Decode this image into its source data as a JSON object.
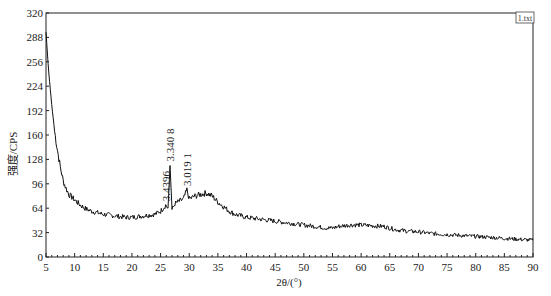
{
  "chart_data": {
    "type": "line",
    "title": "",
    "xlabel": "2θ/(°)",
    "ylabel": "强度/CPS",
    "xlim": [
      5,
      90
    ],
    "ylim": [
      0,
      320
    ],
    "xticks": [
      5,
      10,
      15,
      20,
      25,
      30,
      35,
      40,
      45,
      50,
      55,
      60,
      65,
      70,
      75,
      80,
      85,
      90
    ],
    "yticks": [
      0,
      32,
      64,
      96,
      128,
      160,
      192,
      224,
      256,
      288,
      320
    ],
    "grid": false,
    "legend": {
      "position": "top-right",
      "entries": [
        "1.txt"
      ]
    },
    "series": [
      {
        "name": "1.txt",
        "x": [
          5,
          5.5,
          6,
          6.5,
          7,
          7.5,
          8,
          8.5,
          9,
          10,
          11,
          12,
          13,
          14,
          15,
          16,
          17,
          18,
          19,
          20,
          21,
          22,
          23,
          24,
          25,
          25.9,
          26.3,
          26.65,
          27.0,
          27.5,
          28,
          28.5,
          29,
          29.6,
          30,
          31,
          32,
          33,
          34,
          35,
          36,
          37,
          38,
          40,
          42,
          44,
          46,
          48,
          50,
          52,
          54,
          55,
          56,
          58,
          60,
          62,
          64,
          65,
          66,
          68,
          70,
          72,
          74,
          76,
          78,
          80,
          82,
          84,
          86,
          88,
          90
        ],
        "values": [
          295,
          240,
          200,
          165,
          140,
          118,
          100,
          90,
          82,
          75,
          68,
          63,
          60,
          58,
          56,
          55,
          54,
          53,
          52,
          52,
          53,
          54,
          55,
          56,
          60,
          68,
          64,
          120,
          62,
          70,
          72,
          74,
          76,
          88,
          76,
          80,
          82,
          84,
          80,
          72,
          66,
          60,
          56,
          52,
          50,
          48,
          46,
          44,
          42,
          40,
          38,
          38,
          40,
          42,
          42,
          41,
          40,
          38,
          36,
          34,
          33,
          31,
          30,
          29,
          28,
          27,
          26,
          25,
          24,
          23,
          22
        ]
      }
    ],
    "annotations": [
      {
        "text": "3.4396",
        "x": 25.9,
        "y": 68
      },
      {
        "text": "3.340 8",
        "x": 26.65,
        "y": 120
      },
      {
        "text": "3.019 1",
        "x": 29.6,
        "y": 88
      }
    ]
  }
}
